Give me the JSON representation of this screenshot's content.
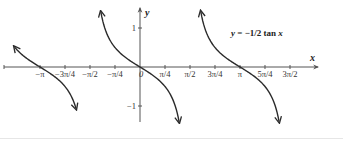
{
  "chart_data": {
    "type": "line",
    "title": "y = −1/2 tan x",
    "equation_parts": {
      "lhs": "y",
      "eq": " = −1/2 tan ",
      "var": "x"
    },
    "xlabel": "x",
    "ylabel": "y",
    "function": "y = -0.5 * tan(x)",
    "xlim": [
      -4.2,
      5.6
    ],
    "ylim": [
      -1.4,
      1.4
    ],
    "grid": false,
    "legend": "none",
    "x_ticks": [
      {
        "value": -3.14159,
        "label": "−π"
      },
      {
        "value": -2.35619,
        "label": "−3π/4"
      },
      {
        "value": -1.5708,
        "label": "−π/2"
      },
      {
        "value": -0.7854,
        "label": "−π/4"
      },
      {
        "value": 0,
        "label": "0"
      },
      {
        "value": 0.7854,
        "label": "π/4"
      },
      {
        "value": 1.5708,
        "label": "π/2"
      },
      {
        "value": 2.35619,
        "label": "3π/4"
      },
      {
        "value": 3.14159,
        "label": "π"
      },
      {
        "value": 3.92699,
        "label": "5π/4"
      },
      {
        "value": 4.71239,
        "label": "3π/2"
      }
    ],
    "y_ticks": [
      {
        "value": 1,
        "label": "1"
      },
      {
        "value": -1,
        "label": "−1"
      }
    ],
    "series": [
      {
        "name": "branch-left",
        "x_range": [
          -3.94,
          -2.01
        ],
        "y_range": [
          0.51,
          -1.4
        ],
        "zero_at": "−π"
      },
      {
        "name": "branch-center",
        "x_range": [
          -1.23,
          1.23
        ],
        "y_range": [
          1.4,
          -1.4
        ],
        "zero_at": "0"
      },
      {
        "name": "branch-right",
        "x_range": [
          1.91,
          4.37
        ],
        "y_range": [
          1.4,
          -1.4
        ],
        "zero_at": "π"
      }
    ],
    "colors": {
      "curve": "#2b2b2b",
      "axis": "#555555",
      "text": "#333333"
    }
  }
}
